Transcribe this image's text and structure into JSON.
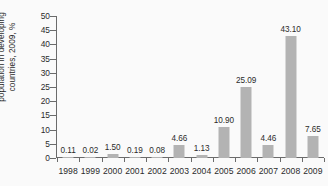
{
  "chart_data": {
    "type": "bar",
    "title": "",
    "subtitle": "",
    "xlabel": "",
    "ylabel_lines": [
      "population in developing",
      "countries, 2009, %"
    ],
    "ylabel": "population in developing countries, 2009, %",
    "categories": [
      "1998",
      "1999",
      "2000",
      "2001",
      "2002",
      "2003",
      "2004",
      "2005",
      "2006",
      "2007",
      "2008",
      "2009"
    ],
    "values": [
      0.11,
      0.02,
      1.5,
      0.19,
      0.08,
      4.66,
      1.13,
      10.9,
      25.09,
      4.46,
      43.1,
      7.65
    ],
    "value_labels": [
      "0.11",
      "0.02",
      "1.50",
      "0.19",
      "0.08",
      "4.66",
      "1.13",
      "10.90",
      "25.09",
      "4.46",
      "43.10",
      "7.65"
    ],
    "ylim": [
      0,
      50
    ],
    "yticks": [
      0,
      5,
      10,
      15,
      20,
      25,
      30,
      35,
      40,
      45,
      50
    ],
    "ytick_labels": [
      "0",
      "5",
      "10",
      "15",
      "20",
      "25",
      "30",
      "35",
      "40",
      "45",
      "50"
    ],
    "grid": false,
    "legend": false,
    "legend_position": "none",
    "bar_color": "#b3b3b3",
    "axis_color": "#6b6b6b",
    "text_color": "#2b2b2b",
    "background_color": "#fafafa"
  }
}
